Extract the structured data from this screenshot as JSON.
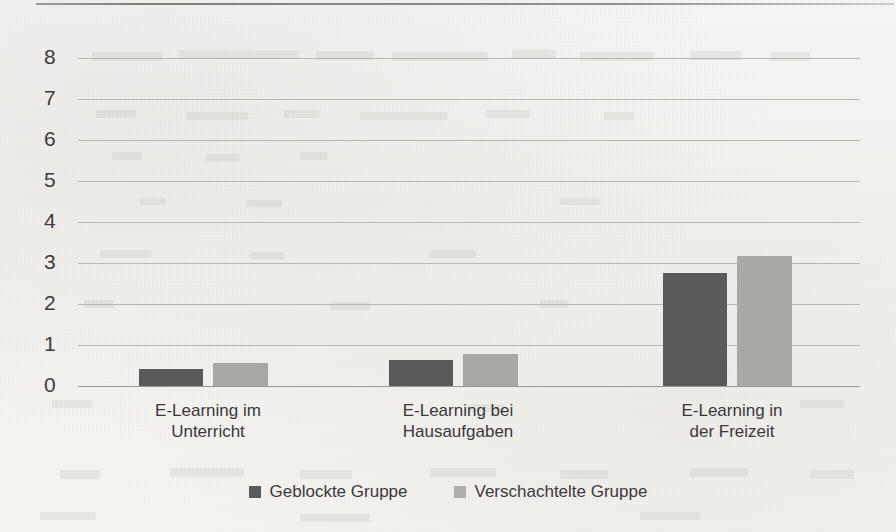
{
  "chart_data": {
    "type": "bar",
    "title": "",
    "subtitle": "",
    "xlabel": "",
    "ylabel": "",
    "ylim": [
      0,
      8
    ],
    "yticks": [
      "0",
      "1",
      "2",
      "3",
      "4",
      "5",
      "6",
      "7",
      "8"
    ],
    "grid": true,
    "legend_position": "bottom-center",
    "categories": [
      "E-Learning im\nUnterricht",
      "E-Learning bei\nHausaufgaben",
      "E-Learning in\nder Freizeit"
    ],
    "category_lines": [
      [
        "E-Learning im",
        "Unterricht"
      ],
      [
        "E-Learning bei",
        "Hausaufgaben"
      ],
      [
        "E-Learning in",
        "der Freizeit"
      ]
    ],
    "series": [
      {
        "name": "Geblockte Gruppe",
        "color": "#5a5a58",
        "values": [
          0.42,
          0.63,
          2.75
        ]
      },
      {
        "name": "Verschachtelte Gruppe",
        "color": "#a9a8a4",
        "values": [
          0.55,
          0.78,
          3.18
        ]
      }
    ]
  },
  "legend": {
    "items": [
      {
        "label": "Geblockte Gruppe",
        "swatch": "dark"
      },
      {
        "label": "Verschachtelte Gruppe",
        "swatch": "light"
      }
    ]
  },
  "axis": {
    "y_tick_0": "0",
    "y_tick_1": "1",
    "y_tick_2": "2",
    "y_tick_3": "3",
    "y_tick_4": "4",
    "y_tick_5": "5",
    "y_tick_6": "6",
    "y_tick_7": "7",
    "y_tick_8": "8"
  },
  "colors": {
    "series_dark": "#5a5a58",
    "series_light": "#a9a8a4",
    "gridline": "#b0aea8",
    "text": "#3a3a3b",
    "paper": "#f5f4f1"
  }
}
